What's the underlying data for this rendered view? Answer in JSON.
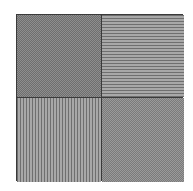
{
  "figure": {
    "layout": "2x2 grid",
    "border_color": "#3a3a3a",
    "cells": [
      {
        "position": "top-left",
        "pattern": "checkerboard",
        "tone": "#808080"
      },
      {
        "position": "top-right",
        "pattern": "horizontal-stripes",
        "tone": "#8c8c8c"
      },
      {
        "position": "bottom-left",
        "pattern": "vertical-stripes",
        "tone": "#8c8c8c"
      },
      {
        "position": "bottom-right",
        "pattern": "checkerboard",
        "tone": "#8a8a8a"
      }
    ]
  }
}
